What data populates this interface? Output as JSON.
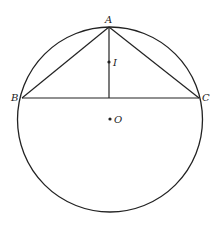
{
  "diagram": {
    "type": "geometry",
    "circle": {
      "center": "O",
      "cx": 110,
      "cy": 119.5,
      "r": 92.5
    },
    "points": [
      {
        "name": "A",
        "x": 109,
        "y": 27,
        "label": "A",
        "lx": 105,
        "ly": 23
      },
      {
        "name": "B",
        "x": 22,
        "y": 98,
        "label": "B",
        "lx": 11,
        "ly": 101
      },
      {
        "name": "C",
        "x": 199,
        "y": 98,
        "label": "C",
        "lx": 202,
        "ly": 101
      },
      {
        "name": "I",
        "x": 109,
        "y": 62,
        "label": "I",
        "lx": 112,
        "ly": 65
      },
      {
        "name": "O",
        "x": 110,
        "y": 119,
        "label": "O",
        "lx": 113,
        "ly": 122
      }
    ],
    "segments": [
      {
        "from": "A",
        "to": "B"
      },
      {
        "from": "A",
        "to": "C"
      },
      {
        "from": "B",
        "to": "C"
      },
      {
        "from": "A",
        "to": "foot",
        "note": "altitude from A to BC"
      }
    ],
    "labels": {
      "A": "A",
      "B": "B",
      "C": "C",
      "I": "I",
      "O": "O"
    },
    "colors": {
      "stroke": "#222222",
      "background": "#ffffff"
    }
  }
}
